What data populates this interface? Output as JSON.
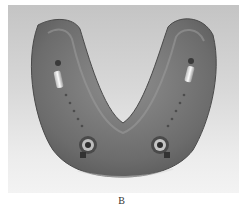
{
  "figure": {
    "caption": "B",
    "colors": {
      "background_top": "#c4c4c4",
      "background_bottom": "#f3f3f3",
      "denture_dark": "#5a5a5a",
      "denture_mid": "#808080",
      "metal_highlight": "#f0f0f0"
    }
  }
}
